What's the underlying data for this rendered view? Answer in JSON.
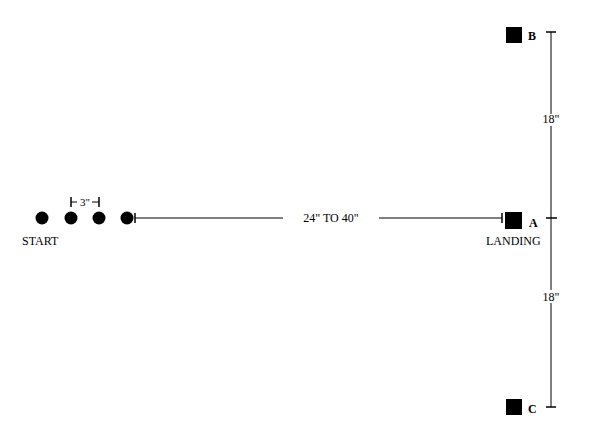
{
  "diagram": {
    "start_label": "START",
    "landing_label": "LANDING",
    "spacing_label": "3\"",
    "distance_label": "24\" TO 40\"",
    "upper_distance_label": "18\"",
    "lower_distance_label": "18\"",
    "marker_a": "A",
    "marker_b": "B",
    "marker_c": "C",
    "colors": {
      "ink": "#000000",
      "background": "#ffffff"
    }
  }
}
